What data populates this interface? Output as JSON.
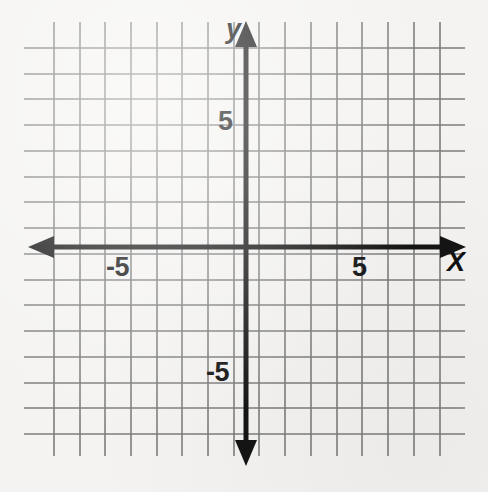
{
  "figure": {
    "kind": "coordinate-plane",
    "background_color": "#f4f3f1",
    "grid_color": "#7d7d7d",
    "axis_color": "#141414",
    "width": 488,
    "height": 492
  },
  "axes": {
    "x_axis_label": "X",
    "y_axis_label": "y",
    "origin_px": {
      "x": 246,
      "y": 247
    },
    "cell_px": 25.8,
    "x_axis_y_px": 247,
    "y_axis_x_px": 246,
    "x_axis_left_tip_px": 28,
    "x_axis_right_tip_px": 466,
    "y_axis_top_tip_px": 21,
    "y_axis_bottom_tip_px": 466
  },
  "tick_labels": {
    "x_negative": "-5",
    "x_positive": "5",
    "y_negative": "-5",
    "y_positive": "5"
  },
  "grid": {
    "vertical_lines_x_px": [
      54,
      80,
      105,
      131,
      157,
      182,
      208,
      234,
      259,
      285,
      311,
      337,
      362,
      388,
      414,
      440
    ],
    "horizontal_lines_y_px": [
      48,
      74,
      99,
      125,
      151,
      177,
      202,
      228,
      254,
      280,
      305,
      331,
      357,
      383,
      408,
      434
    ],
    "vertical_extent_px": {
      "top": 22,
      "bottom": 456
    },
    "horizontal_extent_px": {
      "left": 24,
      "right": 465
    }
  },
  "chart_data": {
    "type": "scatter",
    "title": "",
    "xlabel": "X",
    "ylabel": "y",
    "xlim": [
      -7.5,
      7.5
    ],
    "ylim": [
      -7.5,
      7.5
    ],
    "xticks": [
      -5,
      5
    ],
    "yticks": [
      -5,
      5
    ],
    "xtick_labels": [
      "-5",
      "5"
    ],
    "ytick_labels": [
      "-5",
      "5"
    ],
    "grid": true,
    "grid_step": 1,
    "legend": null,
    "series": [],
    "annotations": []
  }
}
